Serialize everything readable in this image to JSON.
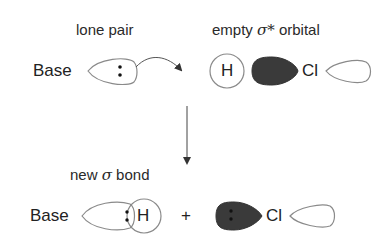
{
  "labels": {
    "lone_pair": "lone pair",
    "empty_orbital_prefix": "empty ",
    "sigma_star": "σ*",
    "empty_orbital_suffix": " orbital",
    "new_bond_prefix": "new ",
    "sigma": "σ",
    "new_bond_suffix": " bond"
  },
  "reactants": {
    "base": "Base",
    "hydrogen": "H",
    "chlorine": "Cl",
    "lone_pair_dots": ":"
  },
  "products": {
    "base": "Base",
    "hydrogen": "H",
    "plus": "+",
    "chlorine": "Cl"
  },
  "colors": {
    "filled_orbital": "#3a3a3a",
    "outline": "#888888",
    "arrow": "#444444"
  }
}
